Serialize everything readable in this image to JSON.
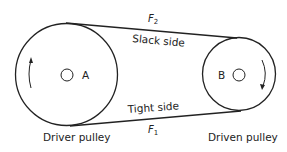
{
  "diagram": {
    "type": "belt-drive",
    "pulleys": [
      {
        "id": "A",
        "label": "A",
        "caption": "Driver pulley",
        "rotation": "counterclockwise-arrow"
      },
      {
        "id": "B",
        "label": "B",
        "caption": "Driven pulley",
        "rotation": "clockwise-arrow"
      }
    ],
    "belt": {
      "top": {
        "side_label": "Slack side",
        "force_label": "F",
        "force_subscript": "2"
      },
      "bottom": {
        "side_label": "Tight side",
        "force_label": "F",
        "force_subscript": "1"
      }
    },
    "colors": {
      "line": "#222222",
      "background": "#ffffff"
    }
  }
}
